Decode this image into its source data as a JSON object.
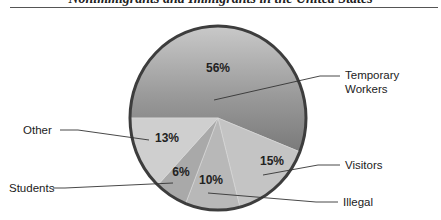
{
  "header": {
    "title": "Nonimmigrants and Immigrants in the United States"
  },
  "chart_data": {
    "type": "pie",
    "title": "Nonimmigrants and Immigrants in the United States",
    "start_angle_deg": 180,
    "direction": "clockwise",
    "slices": [
      {
        "label": "Temporary Workers",
        "value": 56,
        "display": "56%",
        "color": "#8a8a8a"
      },
      {
        "label": "Visitors",
        "value": 15,
        "display": "15%",
        "color": "#c4c4c4"
      },
      {
        "label": "Illegal",
        "value": 10,
        "display": "10%",
        "color": "#b8b8b8"
      },
      {
        "label": "Students",
        "value": 6,
        "display": "6%",
        "color": "#a9a9a9"
      },
      {
        "label": "Other",
        "value": 13,
        "display": "13%",
        "color": "#cfcfcf"
      }
    ],
    "legend_position": "callouts"
  },
  "labels": {
    "temporary_line1": "Temporary",
    "temporary_line2": "Workers",
    "visitors": "Visitors",
    "illegal": "Illegal",
    "students": "Students",
    "other": "Other"
  }
}
